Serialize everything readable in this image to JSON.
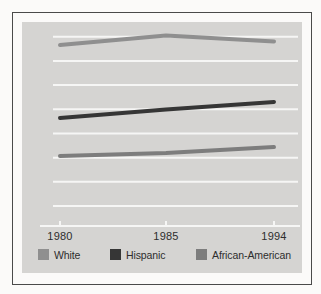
{
  "chart_data": {
    "type": "line",
    "title": "",
    "xlabel": "",
    "ylabel": "",
    "categories": [
      "1980",
      "1985",
      "1994"
    ],
    "series": [
      {
        "name": "White",
        "color": "#8f8f8f",
        "values_pct_of_plot_height": [
          95.6,
          100.7,
          97.5
        ]
      },
      {
        "name": "Hispanic",
        "color": "#363636",
        "values_pct_of_plot_height": [
          57.1,
          61.5,
          65.5
        ]
      },
      {
        "name": "African-American",
        "color": "#7d7d7d",
        "values_pct_of_plot_height": [
          37.0,
          38.5,
          41.7
        ]
      }
    ],
    "x_tick_labels": [
      "1980",
      "1985",
      "1994"
    ],
    "y_axis_tick_labels": [],
    "horizontal_gridlines": 8,
    "grid": true,
    "legend_position": "bottom"
  },
  "colors": {
    "page_bg": "#fbfaf9",
    "frame_border": "#4a4a4a",
    "panel_bg": "#d5d4d2",
    "gridline": "#f6f6f5",
    "axis_line": "#f6f6f5",
    "text": "#2d2d2d"
  }
}
